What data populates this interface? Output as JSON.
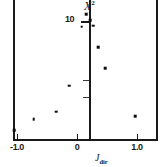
{
  "chart_data": {
    "type": "scatter",
    "title": "",
    "subtitle": "",
    "ylabel": "X",
    "ylabel_superscript": "2",
    "ylabel_full": "X²",
    "xlabel": "J",
    "xlabel_subscript": "dir",
    "xlabel_full": "J_dir",
    "xlim": [
      -1.15,
      1.2
    ],
    "ylim": [
      0,
      12.1
    ],
    "grid": false,
    "legend": null,
    "xticks": [
      -1.0,
      0,
      1.0
    ],
    "xticklabels": [
      "-1.0",
      "0",
      "1.0"
    ],
    "yticks": [
      10
    ],
    "yticklabels": [
      "10"
    ],
    "y_minor_ticks": [
      5.0,
      3.6
    ],
    "marker": "square",
    "marker_color": "#0d0d0d",
    "axis_color": "#1a1a1a",
    "background": "#ffffff",
    "points": [
      {
        "x": -1.05,
        "y": 0.75
      },
      {
        "x": -0.72,
        "y": 1.7
      },
      {
        "x": -0.35,
        "y": 2.3
      },
      {
        "x": -0.13,
        "y": 4.5
      },
      {
        "x": 0.08,
        "y": 9.5
      },
      {
        "x": 0.15,
        "y": 10.6
      },
      {
        "x": 0.22,
        "y": 10.05
      },
      {
        "x": 0.27,
        "y": 9.6
      },
      {
        "x": 0.35,
        "y": 7.8
      },
      {
        "x": 0.47,
        "y": 6.0
      },
      {
        "x": 0.97,
        "y": 1.95
      }
    ],
    "x_values": [
      -1.05,
      -0.72,
      -0.35,
      -0.13,
      0.08,
      0.15,
      0.22,
      0.27,
      0.35,
      0.47,
      0.97
    ],
    "y_values": [
      0.75,
      1.7,
      2.3,
      4.5,
      9.5,
      10.6,
      10.05,
      9.6,
      7.8,
      6.0,
      1.95
    ]
  },
  "geometry": {
    "x_pixel_at_minus_one": 17,
    "x_pixel_at_zero": 77,
    "x_pixel_at_plus_one": 137,
    "y_pixel_at_ten": 21,
    "y_pixel_at_zero": 139,
    "minor_tick_y_pixels": [
      70,
      88
    ]
  }
}
